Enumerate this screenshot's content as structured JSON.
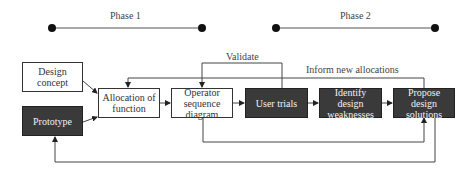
{
  "phases": [
    {
      "label": "Phase 1"
    },
    {
      "label": "Phase 2"
    }
  ],
  "nodes": {
    "design_concept": {
      "label": "Design concept",
      "style": "light"
    },
    "prototype": {
      "label": "Prototype",
      "style": "dark"
    },
    "allocation": {
      "label": "Allocation of function",
      "style": "light"
    },
    "operator": {
      "label": "Operator sequence diagram",
      "style": "light"
    },
    "user_trials": {
      "label": "User trials",
      "style": "dark"
    },
    "identify": {
      "label": "Identify design weaknesses",
      "style": "dark"
    },
    "propose": {
      "label": "Propose design solutions",
      "style": "dark"
    }
  },
  "edge_labels": {
    "validate": "Validate",
    "inform": "Inform new allocations"
  },
  "colors": {
    "dark_fill": "#3a3a3a",
    "line": "#444444",
    "light_fill": "#ffffff"
  }
}
